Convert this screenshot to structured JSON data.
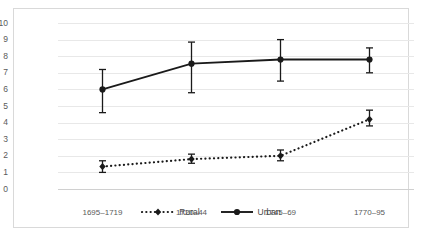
{
  "chart_data": {
    "type": "line",
    "title": "",
    "xlabel": "",
    "ylabel": "",
    "categories": [
      "1695–1719",
      "1720–44",
      "1745–69",
      "1770–95"
    ],
    "ylim": [
      0,
      10
    ],
    "yticks": [
      0,
      1,
      2,
      3,
      4,
      5,
      6,
      7,
      8,
      9,
      10
    ],
    "ytick_labels": [
      "0",
      "1",
      "2",
      "3",
      "4",
      "5",
      "6",
      "7",
      "8",
      "9",
      "10"
    ],
    "grid": true,
    "legend_position": "bottom",
    "series": [
      {
        "name": "Rural",
        "style": "dotted",
        "marker": "diamond",
        "color": "#1a1a1a",
        "values": [
          1.35,
          1.8,
          2.0,
          4.2
        ],
        "error_low": [
          1.0,
          1.55,
          1.7,
          3.8
        ],
        "error_high": [
          1.7,
          2.1,
          2.35,
          4.75
        ]
      },
      {
        "name": "Urban",
        "style": "solid",
        "marker": "circle",
        "color": "#1a1a1a",
        "values": [
          6.0,
          7.55,
          7.8,
          7.8
        ],
        "error_low": [
          4.6,
          5.8,
          6.5,
          7.0
        ],
        "error_high": [
          7.2,
          8.85,
          9.0,
          8.5
        ]
      }
    ]
  },
  "legend": {
    "items": [
      {
        "label": "Rural"
      },
      {
        "label": "Urban"
      }
    ]
  }
}
